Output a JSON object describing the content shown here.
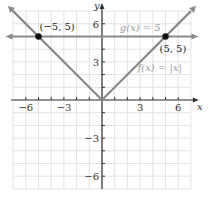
{
  "chart_data": {
    "type": "line",
    "title": "",
    "xlabel": "x",
    "ylabel": "y",
    "xlim": [
      -7,
      7
    ],
    "ylim": [
      -7,
      7
    ],
    "grid": true,
    "x_ticks": [
      -6,
      -3,
      3,
      6
    ],
    "y_ticks": [
      -6,
      -3,
      3,
      6
    ],
    "x_tick_labels": [
      "−6",
      "−3",
      "3",
      "6"
    ],
    "y_tick_labels": [
      "−6",
      "−3",
      "3",
      "6"
    ],
    "series": [
      {
        "name": "f(x) = |x|",
        "label": "f(x) = |x|",
        "points": [
          [
            -7,
            7
          ],
          [
            0,
            0
          ],
          [
            7,
            7
          ]
        ],
        "color": "#8a8a8a"
      },
      {
        "name": "g(x) = 5",
        "label": "g(x) = 5",
        "points": [
          [
            -7,
            5
          ],
          [
            7,
            5
          ]
        ],
        "color": "#8a8a8a"
      }
    ],
    "annotations": [
      {
        "text": "(−5, 5)",
        "x": -5,
        "y": 5,
        "marker": true
      },
      {
        "text": "(5, 5)",
        "x": 5,
        "y": 5,
        "marker": true
      }
    ]
  }
}
